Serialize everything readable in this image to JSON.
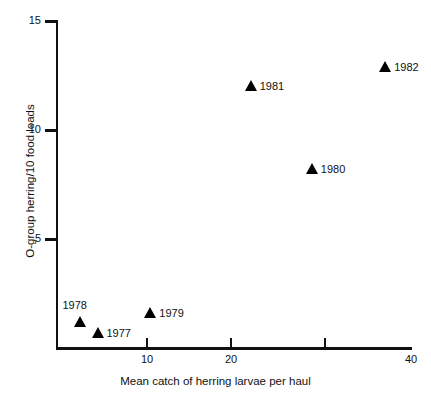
{
  "chart_data": {
    "type": "scatter",
    "title": "",
    "xlabel": "Mean catch of herring larvae per haul",
    "ylabel": "O-group herring/10 food loads",
    "xlim": [
      2,
      40
    ],
    "ylim": [
      0,
      15
    ],
    "grid": false,
    "legend": "none",
    "x_ticks": [
      {
        "value": 10,
        "label": "10"
      },
      {
        "value": 20,
        "label": "20"
      },
      {
        "value": 30,
        "label": ""
      },
      {
        "value": 40,
        "label": "40"
      }
    ],
    "y_ticks": [
      {
        "value": 5,
        "label": "5"
      },
      {
        "value": 10,
        "label": "10"
      },
      {
        "value": 15,
        "label": "15"
      }
    ],
    "points": [
      {
        "label": "1978",
        "x": 4.0,
        "y": 1.2,
        "label_pos": "above"
      },
      {
        "label": "1977",
        "x": 5.6,
        "y": 0.7,
        "label_pos": "right"
      },
      {
        "label": "1979",
        "x": 10.4,
        "y": 1.6,
        "label_pos": "right"
      },
      {
        "label": "1980",
        "x": 28.6,
        "y": 8.2,
        "label_pos": "right"
      },
      {
        "label": "1981",
        "x": 22.1,
        "y": 12.0,
        "label_pos": "right"
      },
      {
        "label": "1982",
        "x": 37.0,
        "y": 12.9,
        "label_pos": "right"
      }
    ],
    "marker_symbol": "triangle-up",
    "marker_color": "#000000",
    "axis_color": "#111111"
  }
}
